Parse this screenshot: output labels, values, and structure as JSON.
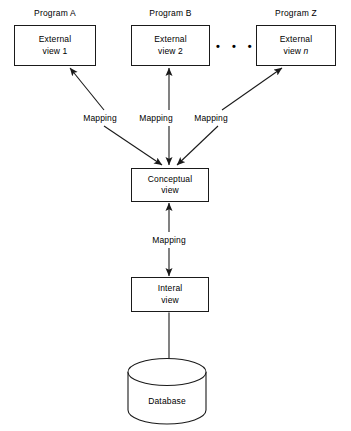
{
  "diagram": {
    "colors": {
      "background": "#ffffff",
      "stroke": "#1a1a1a",
      "text": "#000000"
    },
    "program_labels": [
      {
        "text": "Program A"
      },
      {
        "text": "Program B"
      },
      {
        "text": "Program Z"
      }
    ],
    "external_views": [
      {
        "line1": "External",
        "line2": "view 1",
        "italic_suffix": ""
      },
      {
        "line1": "External",
        "line2": "view 2",
        "italic_suffix": ""
      },
      {
        "line1": "External",
        "line2": "view ",
        "italic_suffix": "n"
      }
    ],
    "ellipsis": "• • •",
    "mapping_labels": [
      {
        "text": "Mapping"
      },
      {
        "text": "Mapping"
      },
      {
        "text": "Mapping"
      }
    ],
    "conceptual_view": {
      "line1": "Conceptual",
      "line2": "view"
    },
    "middle_mapping_label": {
      "text": "Mapping"
    },
    "internal_view": {
      "line1": "Interal",
      "line2": "view"
    },
    "database": {
      "label": "Database"
    }
  }
}
